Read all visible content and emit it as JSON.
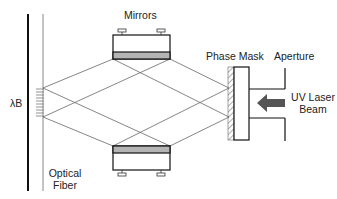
{
  "diagram": {
    "type": "fiber-bragg-grating-writing-setup",
    "labels": {
      "mirrors": "Mirrors",
      "phase_mask": "Phase Mask",
      "aperture": "Aperture",
      "uv_laser_line1": "UV Laser",
      "uv_laser_line2": "Beam",
      "lambda_b": "λB",
      "optical_fiber_line1": "Optical",
      "optical_fiber_line2": "Fiber"
    },
    "colors": {
      "line": "#222222",
      "ray": "#666666",
      "mirror_coating": "#b4b4b4",
      "arrow": "#555555",
      "background": "#ffffff"
    },
    "components": [
      {
        "name": "Optical Fiber",
        "role": "target"
      },
      {
        "name": "Bragg grating (λB)",
        "role": "written grating"
      },
      {
        "name": "Mirrors",
        "count": 2
      },
      {
        "name": "Phase Mask",
        "role": "diffracts beam"
      },
      {
        "name": "Aperture",
        "role": "beam limiter"
      },
      {
        "name": "UV Laser Beam",
        "direction": "right-to-left"
      }
    ]
  }
}
